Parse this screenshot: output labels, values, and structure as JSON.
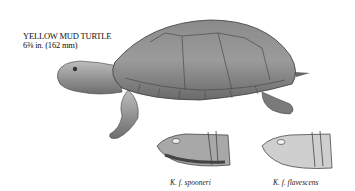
{
  "label": {
    "name": "YELLOW MUD TURTLE",
    "size": "6⅜ in. (162 mm)"
  },
  "captions": [
    {
      "text": "K. f. spooneri"
    },
    {
      "text": "K. f. flavescens"
    }
  ],
  "illustration": {
    "subject": "yellow-mud-turtle",
    "style": "grayscale pencil drawing"
  }
}
